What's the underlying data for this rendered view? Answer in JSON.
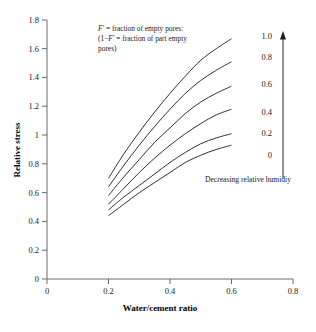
{
  "chart_data": {
    "type": "line",
    "title": "",
    "xlabel": "Water/cement ratio",
    "ylabel": "Relative stress",
    "xlim": [
      0,
      0.8
    ],
    "ylim": [
      0,
      1.8
    ],
    "xticks": [
      "0",
      "0.2",
      "0.4",
      "0.6",
      "0.8"
    ],
    "xtick_values": [
      0,
      0.2,
      0.4,
      0.6,
      0.8
    ],
    "yticks": [
      "0",
      "0.2",
      "0.4",
      "0.6",
      "0.8",
      "1",
      "1.2",
      "1.4",
      "1.6",
      "1.8"
    ],
    "ytick_values": [
      0,
      0.2,
      0.4,
      0.6,
      0.8,
      1.0,
      1.2,
      1.4,
      1.6,
      1.8
    ],
    "grid": false,
    "legend_position": "right-inside",
    "x": [
      0.2,
      0.25,
      0.3,
      0.35,
      0.4,
      0.45,
      0.5,
      0.55,
      0.6
    ],
    "series": [
      {
        "name": "F' = 1.0",
        "label": "1.0",
        "values": [
          0.7,
          0.87,
          1.02,
          1.16,
          1.29,
          1.41,
          1.52,
          1.6,
          1.67
        ]
      },
      {
        "name": "F' = 0.8",
        "label": "0.8",
        "values": [
          0.64,
          0.79,
          0.93,
          1.06,
          1.18,
          1.29,
          1.38,
          1.45,
          1.51
        ]
      },
      {
        "name": "F' = 0.6",
        "label": "0.6",
        "values": [
          0.58,
          0.71,
          0.83,
          0.95,
          1.05,
          1.15,
          1.23,
          1.29,
          1.34
        ]
      },
      {
        "name": "F' = 0.4",
        "label": "0.4",
        "values": [
          0.52,
          0.63,
          0.74,
          0.84,
          0.93,
          1.01,
          1.08,
          1.14,
          1.18
        ]
      },
      {
        "name": "F' = 0.2",
        "label": "0.2",
        "values": [
          0.48,
          0.57,
          0.65,
          0.73,
          0.81,
          0.88,
          0.94,
          0.98,
          1.01
        ]
      },
      {
        "name": "F' = 0",
        "label": "0",
        "values": [
          0.44,
          0.52,
          0.6,
          0.67,
          0.74,
          0.81,
          0.86,
          0.9,
          0.93
        ]
      }
    ],
    "annotations": {
      "definition_line1_italic": "F'",
      "definition_line1_rest": " = fraction of empty pores:",
      "definition_line2_pre": "(1−",
      "definition_line2_italic": "F'",
      "definition_line2_rest": " = fraction of part empty",
      "definition_line3": "pores)",
      "humidity_arrow_label": "Decreasing relative humidiy",
      "scale_labels": [
        "1.0",
        "0.8",
        "0.6",
        "0.4",
        "0.2",
        "0"
      ]
    },
    "colors": {
      "curve": "#1a1a1a",
      "axis": "#5a5a5a",
      "text": "#1a1a1a",
      "background": "#ffffff"
    }
  },
  "caption": {
    "cut_off_text": ""
  }
}
